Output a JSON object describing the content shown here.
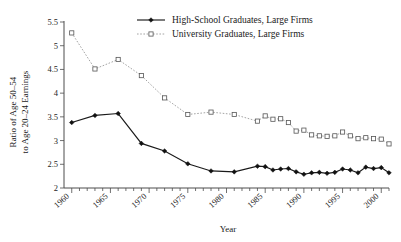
{
  "chart_data": {
    "type": "line",
    "title": "",
    "xlabel": "Year",
    "ylabel": "Ratio of Age 50–54 to Age 20–24 Earnings",
    "ylabel_line1": "Ratio of Age 50–54",
    "ylabel_line2": "to Age 20–24 Earnings",
    "xlim": [
      1959,
      2001
    ],
    "ylim": [
      2,
      5.5
    ],
    "grid": false,
    "legend_position": "top-center",
    "yticks": [
      "2",
      "2.5",
      "3",
      "3.5",
      "4",
      "4.5",
      "5",
      "5.5"
    ],
    "ytick_values": [
      2,
      2.5,
      3,
      3.5,
      4,
      4.5,
      5,
      5.5
    ],
    "xticks": [
      "1960",
      "1965",
      "1970",
      "1975",
      "1980",
      "1985",
      "1990",
      "1995",
      "2000"
    ],
    "xtick_values": [
      1960,
      1965,
      1970,
      1975,
      1980,
      1985,
      1990,
      1995,
      2000
    ],
    "xminor_step": 1,
    "series": [
      {
        "name": "High-School Graduates, Large Firms",
        "color": "#1a1a1a",
        "marker": "filled-diamond",
        "linestyle": "solid",
        "x": [
          1960,
          1963,
          1966,
          1969,
          1972,
          1975,
          1978,
          1981,
          1984,
          1985,
          1986,
          1987,
          1988,
          1989,
          1990,
          1991,
          1992,
          1993,
          1994,
          1995,
          1996,
          1997,
          1998,
          1999,
          2000,
          2001
        ],
        "values": [
          3.38,
          3.53,
          3.57,
          2.94,
          2.78,
          2.51,
          2.36,
          2.34,
          2.46,
          2.45,
          2.38,
          2.4,
          2.41,
          2.34,
          2.29,
          2.32,
          2.33,
          2.31,
          2.33,
          2.4,
          2.38,
          2.32,
          2.44,
          2.41,
          2.43,
          2.32
        ]
      },
      {
        "name": "University Graduates, Large Firms",
        "color": "#9a9a9a",
        "marker": "open-square",
        "linestyle": "dotted",
        "x": [
          1960,
          1963,
          1966,
          1969,
          1972,
          1975,
          1978,
          1981,
          1984,
          1985,
          1986,
          1987,
          1988,
          1989,
          1990,
          1991,
          1992,
          1993,
          1994,
          1995,
          1996,
          1997,
          1998,
          1999,
          2000,
          2001
        ],
        "values": [
          5.27,
          4.51,
          4.71,
          4.37,
          3.9,
          3.55,
          3.6,
          3.55,
          3.41,
          3.52,
          3.45,
          3.46,
          3.38,
          3.2,
          3.22,
          3.12,
          3.1,
          3.09,
          3.1,
          3.18,
          3.1,
          3.04,
          3.06,
          3.04,
          3.03,
          2.93
        ]
      }
    ]
  },
  "legend": {
    "items": [
      {
        "label": "High-School Graduates, Large Firms",
        "style": "solid-diamond"
      },
      {
        "label": "University Graduates, Large Firms",
        "style": "dotted-square"
      }
    ]
  }
}
